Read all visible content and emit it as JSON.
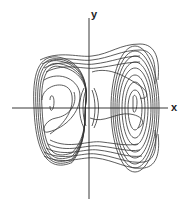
{
  "figure": {
    "type": "phase-portrait",
    "axis_labels": {
      "x": "x",
      "y": "y"
    },
    "colors": {
      "background": "#ffffff",
      "axis": "#222222",
      "trajectory": "#333333"
    },
    "origin_px": [
      89,
      108
    ],
    "x_axis_px": [
      12,
      168
    ],
    "y_axis_px": [
      18,
      199
    ]
  },
  "left_lobe": {
    "center_px": [
      52,
      108
    ],
    "outer_loops": [
      {
        "rx": 38,
        "ryTop": 55,
        "ryBot": 62
      },
      {
        "rx": 36,
        "ryTop": 53,
        "ryBot": 60
      },
      {
        "rx": 34,
        "ryTop": 51,
        "ryBot": 58
      },
      {
        "rx": 32,
        "ryTop": 48,
        "ryBot": 55
      },
      {
        "rx": 30,
        "ryTop": 45,
        "ryBot": 51
      }
    ],
    "inner_curves": [
      "M50,100 C50,94 54,94 54,102 C54,110 50,114 50,106",
      "M44,80 C60,70 80,80 80,96 C80,112 66,128 48,132 C40,134 44,120 56,118 C68,116 78,106 74,92",
      "M42,100 C42,84 70,78 72,96 C74,112 62,126 50,134"
    ]
  },
  "right_lobe": {
    "center_px": [
      135,
      108
    ],
    "outer_loops": [
      {
        "rx": 24,
        "ryTop": 62,
        "ryBot": 64
      },
      {
        "rx": 22,
        "ryTop": 57,
        "ryBot": 60
      },
      {
        "rx": 20,
        "ryTop": 52,
        "ryBot": 56
      },
      {
        "rx": 18,
        "ryTop": 46,
        "ryBot": 50
      },
      {
        "rx": 16,
        "ryTop": 40,
        "ryBot": 44
      },
      {
        "rx": 13,
        "ryTop": 33,
        "ryBot": 37
      },
      {
        "rx": 10,
        "ryTop": 26,
        "ryBot": 30
      },
      {
        "rx": 7,
        "ryTop": 18,
        "ryBot": 22
      }
    ],
    "inner_curves": [
      "M133,98 C133,94 137,94 137,102 C137,112 133,116 133,108 Z",
      "M92,72 C110,66 128,78 140,86 C150,92 148,100 140,98",
      "M90,118 C104,124 116,112 130,114 C144,116 146,124 138,128"
    ]
  },
  "bridges": [
    "M40,60 C60,50 80,58 92,56 C110,54 120,44 140,44 C156,44 160,60 158,80",
    "M42,64 C62,54 80,62 92,60 C110,58 122,50 140,50 C154,50 156,64 155,84",
    "M44,68 C64,58 82,66 94,64 C112,62 124,56 140,56",
    "M46,72 C66,62 84,70 96,68 C114,66 126,62 140,62",
    "M44,156 C64,166 82,156 96,158 C114,160 128,170 144,168 C158,166 160,150 158,134",
    "M44,152 C64,162 82,152 96,154 C114,156 128,164 144,162 C156,160 157,146 155,130",
    "M46,148 C66,158 84,148 98,150 C116,152 128,158 142,156",
    "M48,144 C68,154 86,144 100,146 C118,148 128,152 140,150",
    "M50,140 C70,150 88,140 102,142 C118,144 128,146 138,144"
  ],
  "pinch": {
    "center_px": [
      89,
      108
    ],
    "curves": [
      "M86,90 C82,100 82,116 86,126",
      "M92,90 C96,100 96,116 92,126",
      "M84,88 C78,100 78,116 84,128",
      "M94,88 C100,100 100,116 94,128"
    ]
  }
}
